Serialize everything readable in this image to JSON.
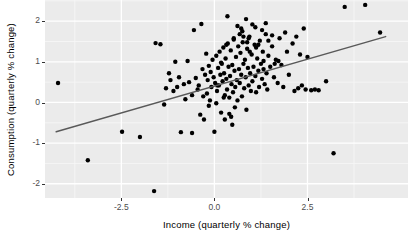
{
  "chart_data": {
    "type": "scatter",
    "title": "",
    "subtitle": "",
    "xlabel": "Income (quarterly % change)",
    "ylabel": "Consumption (quarterly % change)",
    "xlim": [
      -4.55,
      5.2
    ],
    "ylim": [
      -2.35,
      2.52
    ],
    "xticks": [
      -2.5,
      0.0,
      2.5
    ],
    "xticklabels": [
      "-2.5",
      "0.0",
      "2.5"
    ],
    "yticks": [
      -2,
      -1,
      0,
      1,
      2
    ],
    "yticklabels": [
      "-2",
      "-1",
      "0",
      "1",
      "2"
    ],
    "grid": true,
    "grid_major_color": "#ffffff",
    "grid_minor_color": "#f7f7f7",
    "panel_background": "#ebebeb",
    "point_color": "#000000",
    "point_size": 2.2,
    "legend": "none",
    "annotations": [],
    "series": [
      {
        "name": "Quarterly observations",
        "marker": "filled-circle",
        "color": "#000000",
        "x": [
          -4.2,
          -3.4,
          -2.48,
          -2.0,
          -1.62,
          -1.58,
          -1.45,
          -1.35,
          -1.3,
          -1.22,
          -1.18,
          -1.1,
          -1.05,
          -0.95,
          -0.9,
          -0.82,
          -0.78,
          -0.72,
          -0.68,
          -0.6,
          -0.55,
          -0.5,
          -0.45,
          -0.42,
          -0.38,
          -0.35,
          -0.32,
          -0.3,
          -0.28,
          -0.25,
          -0.22,
          -0.2,
          -0.18,
          -0.15,
          -0.12,
          -0.1,
          -0.08,
          -0.05,
          -0.02,
          0.0,
          0.02,
          0.05,
          0.07,
          0.1,
          0.12,
          0.14,
          0.16,
          0.18,
          0.2,
          0.22,
          0.24,
          0.26,
          0.28,
          0.3,
          0.32,
          0.34,
          0.36,
          0.38,
          0.4,
          0.42,
          0.44,
          0.46,
          0.48,
          0.5,
          0.52,
          0.54,
          0.56,
          0.58,
          0.6,
          0.62,
          0.64,
          0.66,
          0.68,
          0.7,
          0.72,
          0.74,
          0.76,
          0.78,
          0.8,
          0.82,
          0.84,
          0.86,
          0.88,
          0.9,
          0.92,
          0.94,
          0.96,
          0.98,
          1.0,
          1.02,
          1.05,
          1.08,
          1.1,
          1.12,
          1.15,
          1.18,
          1.2,
          1.22,
          1.25,
          1.28,
          1.3,
          1.32,
          1.35,
          1.38,
          1.4,
          1.42,
          1.45,
          1.5,
          1.55,
          1.6,
          1.65,
          1.7,
          1.75,
          1.8,
          1.85,
          1.9,
          1.95,
          2.0,
          2.1,
          2.15,
          2.2,
          2.25,
          2.3,
          2.35,
          2.4,
          2.45,
          2.5,
          2.6,
          2.7,
          2.8,
          3.0,
          3.2,
          3.5,
          4.05,
          4.45,
          -1.0,
          -0.6,
          0.28,
          0.85,
          1.1,
          0.45,
          0.62,
          0.05,
          0.35,
          1.38,
          -0.15,
          0.75,
          1.55,
          0.92,
          1.72,
          0.18,
          0.55,
          1.02,
          1.28,
          0.68,
          0.4,
          1.12,
          0.88,
          0.25,
          1.45,
          0.52,
          0.78,
          1.18,
          0.32,
          0.95,
          1.62,
          0.08,
          0.48,
          1.32,
          0.72
        ],
        "y": [
          0.48,
          -1.42,
          -0.72,
          -0.85,
          -2.18,
          1.46,
          1.43,
          -0.05,
          0.35,
          0.72,
          0.55,
          0.28,
          1.0,
          0.62,
          -0.73,
          0.45,
          0.08,
          1.02,
          0.5,
          0.18,
          1.78,
          0.6,
          0.32,
          0.42,
          -0.3,
          1.93,
          0.82,
          0.15,
          -0.42,
          0.68,
          1.2,
          0.22,
          0.55,
          0.9,
          0.05,
          0.75,
          0.38,
          1.05,
          0.62,
          -0.72,
          0.48,
          1.15,
          0.28,
          0.85,
          0.42,
          1.25,
          0.68,
          -0.25,
          0.95,
          0.52,
          1.35,
          0.72,
          0.18,
          1.08,
          0.58,
          0.32,
          1.45,
          0.88,
          0.12,
          0.65,
          1.28,
          0.45,
          0.92,
          0.25,
          1.55,
          0.78,
          0.38,
          1.12,
          0.55,
          0.05,
          1.38,
          0.82,
          0.48,
          1.22,
          0.68,
          0.15,
          1.48,
          0.95,
          0.35,
          1.05,
          0.62,
          -0.18,
          1.32,
          0.85,
          0.42,
          1.62,
          0.72,
          0.28,
          1.18,
          0.52,
          0.88,
          1.42,
          0.65,
          0.25,
          1.08,
          0.78,
          0.38,
          1.52,
          0.95,
          0.58,
          1.25,
          0.82,
          0.45,
          1.68,
          0.72,
          0.32,
          1.15,
          0.88,
          1.38,
          0.62,
          1.05,
          0.48,
          1.58,
          0.92,
          0.38,
          1.72,
          1.25,
          0.68,
          1.45,
          0.28,
          1.62,
          0.35,
          1.18,
          0.42,
          1.82,
          0.32,
          1.12,
          0.3,
          0.32,
          0.3,
          0.52,
          -1.25,
          2.35,
          2.4,
          1.72,
          0.38,
          -0.75,
          -0.42,
          2.05,
          1.85,
          -0.35,
          1.88,
          -0.02,
          2.12,
          1.95,
          -0.08,
          1.75,
          1.65,
          1.58,
          1.02,
          0.98,
          -0.12,
          1.92,
          1.78,
          1.68,
          -0.28,
          1.35,
          1.48,
          0.12,
          1.52,
          1.58,
          1.62,
          1.42,
          1.42,
          1.25,
          0.95,
          0.42,
          -0.55,
          1.02,
          1.82
        ]
      }
    ],
    "fit_line": {
      "name": "linear-fit",
      "color": "#595959",
      "width": 1.4,
      "x0": -4.25,
      "y0": -0.72,
      "x1": 4.6,
      "y1": 1.62
    }
  }
}
